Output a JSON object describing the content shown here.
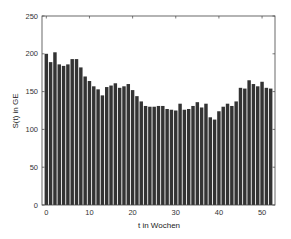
{
  "chart_data": {
    "type": "bar",
    "title": "",
    "xlabel": "t in Wochen",
    "ylabel": "S(t) in GE",
    "xlim": [
      -1,
      53
    ],
    "ylim": [
      0,
      250
    ],
    "xticks": [
      0,
      10,
      20,
      30,
      40,
      50
    ],
    "yticks": [
      0,
      50,
      100,
      150,
      200,
      250
    ],
    "grid": false,
    "legend": null,
    "bar_color": "#333333",
    "x": [
      0,
      1,
      2,
      3,
      4,
      5,
      6,
      7,
      8,
      9,
      10,
      11,
      12,
      13,
      14,
      15,
      16,
      17,
      18,
      19,
      20,
      21,
      22,
      23,
      24,
      25,
      26,
      27,
      28,
      29,
      30,
      31,
      32,
      33,
      34,
      35,
      36,
      37,
      38,
      39,
      40,
      41,
      42,
      43,
      44,
      45,
      46,
      47,
      48,
      49,
      50,
      51,
      52
    ],
    "values": [
      200,
      189,
      202,
      186,
      184,
      186,
      193,
      193,
      182,
      170,
      164,
      157,
      153,
      145,
      156,
      158,
      161,
      155,
      157,
      160,
      152,
      144,
      137,
      131,
      130,
      130,
      131,
      131,
      127,
      126,
      125,
      134,
      126,
      127,
      131,
      136,
      129,
      134,
      116,
      113,
      124,
      130,
      134,
      131,
      137,
      155,
      154,
      165,
      160,
      157,
      163,
      155,
      154
    ]
  }
}
